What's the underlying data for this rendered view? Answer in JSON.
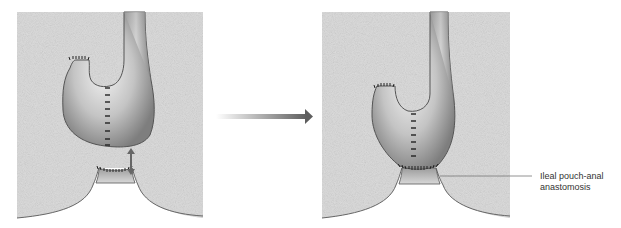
{
  "diagram": {
    "panels": [
      {
        "name": "before",
        "description": "J-pouch separated from anal canal with approximation arrow"
      },
      {
        "name": "after",
        "description": "J-pouch joined to anal canal"
      }
    ],
    "transition_arrow": "arrow-right",
    "label": {
      "line1": "Ileal pouch-anal",
      "line2": "anastomosis"
    },
    "colors": {
      "tissue": "#d9d9d9",
      "pouch_light": "#e8e8e8",
      "pouch_dark": "#8c8c8c",
      "outline": "#555555",
      "suture": "#222222",
      "arrow": "#6b6b6b"
    }
  }
}
